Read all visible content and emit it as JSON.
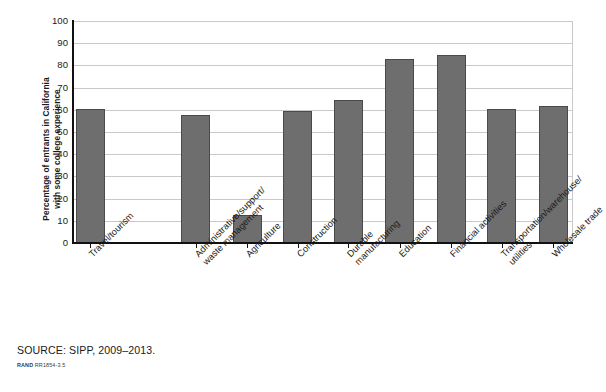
{
  "chart_data": {
    "type": "bar",
    "title": "",
    "xlabel": "",
    "ylabel": "Percentage of entrants in California with some college experience",
    "ylabel_lines": [
      "Percentage of entrants in California",
      "with some college experience"
    ],
    "categories": [
      "Travel/tourism",
      "Administrative/support/ waste management",
      "Agriculture",
      "Construction",
      "Durable manufacturing",
      "Education",
      "Financial activities",
      "Transportation/warehouse/ utilities",
      "Wholesale trade"
    ],
    "category_lines": [
      [
        "Travel/tourism"
      ],
      [
        "Administrative/support/",
        "waste management"
      ],
      [
        "Agriculture"
      ],
      [
        "Construction"
      ],
      [
        "Durable",
        "manufacturing"
      ],
      [
        "Education"
      ],
      [
        "Financial activities"
      ],
      [
        "Transportation/warehouse/",
        "utilities"
      ],
      [
        "Wholesale trade"
      ]
    ],
    "values": [
      60.5,
      57.5,
      12.5,
      59.5,
      64.5,
      83.0,
      84.5,
      60.5,
      61.5
    ],
    "ylim": [
      0,
      100
    ],
    "ytick_values": [
      0,
      10,
      20,
      30,
      40,
      50,
      60,
      70,
      80,
      90,
      100
    ],
    "ytick_labels": [
      "0",
      "10",
      "20",
      "30",
      "40",
      "50",
      "60",
      "70",
      "80",
      "90",
      "100"
    ],
    "grid": true,
    "grid_axis": "y",
    "legend": false,
    "bar_color": "#6e6e6e",
    "bar_edge_color": "#4a4a4a",
    "grid_color": "#c9c9c9",
    "axis_color": "#111111"
  },
  "footer": {
    "source": "SOURCE: SIPP, 2009–2013.",
    "rand_brand": "RAND",
    "rand_code": "RR1854-3.5"
  }
}
